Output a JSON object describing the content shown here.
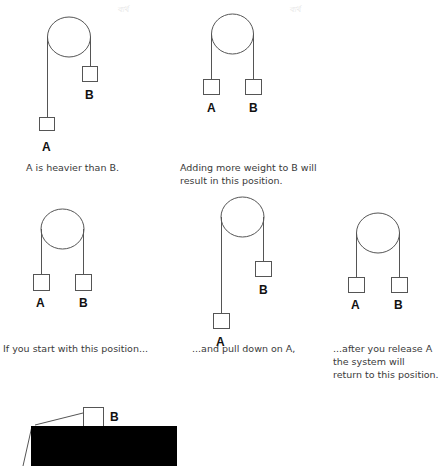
{
  "watermarks": [
    "ব্যর্থ",
    "ব্যর্থ"
  ],
  "colors": {
    "stroke": "#555555",
    "label": "#111111",
    "caption": "#3a3a3a",
    "block": "#000000"
  },
  "diagrams": [
    {
      "id": "d1",
      "labels": {
        "a": "A",
        "b": "B"
      },
      "caption": "A is heavier than B."
    },
    {
      "id": "d2",
      "labels": {
        "a": "A",
        "b": "B"
      },
      "caption": "Adding more weight to B will\nresult in this position."
    },
    {
      "id": "d3",
      "labels": {
        "a": "A",
        "b": "B"
      },
      "caption": "If you start with this position..."
    },
    {
      "id": "d4",
      "labels": {
        "a": "A",
        "b": "B"
      },
      "caption": "...and pull down on A,"
    },
    {
      "id": "d5",
      "labels": {
        "a": "A",
        "b": "B"
      },
      "caption": "...after you release A\nthe system will\nreturn to this position."
    },
    {
      "id": "d6",
      "labels": {
        "b": "B"
      }
    }
  ]
}
